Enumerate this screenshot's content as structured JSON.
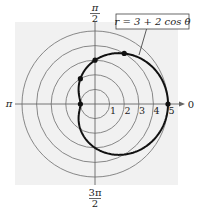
{
  "figure": {
    "equation_label": "r = 3 + 2 cos θ",
    "axis_labels": {
      "top_num": "π",
      "top_den": "2",
      "left": "π",
      "right": "0",
      "bottom_num": "3π",
      "bottom_den": "2"
    },
    "ring_labels": [
      "1",
      "2",
      "3",
      "4",
      "5"
    ],
    "colors": {
      "background_panel": "#f2f2f2",
      "grid": "#7a7a7a",
      "curve": "#111111"
    },
    "marked_points_polar": [
      {
        "r": 5,
        "theta": "0"
      },
      {
        "r": 4,
        "theta": "π/3"
      },
      {
        "r": 3,
        "theta": "π/2"
      },
      {
        "r": 2,
        "theta": "2π/3"
      },
      {
        "r": 1,
        "theta": "π"
      }
    ]
  }
}
